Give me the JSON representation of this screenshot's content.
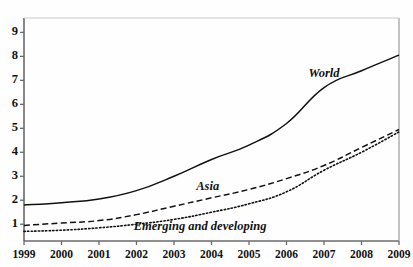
{
  "chart_data": {
    "type": "line",
    "title": "",
    "subtitle": "",
    "xlabel": "",
    "ylabel": "",
    "x": [
      1999,
      2000,
      2001,
      2002,
      2003,
      2004,
      2005,
      2006,
      2007,
      2008,
      2009
    ],
    "xtick_labels": [
      "1999",
      "2000",
      "2001",
      "2002",
      "2003",
      "2004",
      "2005",
      "2006",
      "2007",
      "2008",
      "2009"
    ],
    "ytick_labels": [
      "1",
      "2",
      "3",
      "4",
      "5",
      "6",
      "7",
      "8",
      "9"
    ],
    "ytick_values": [
      1,
      2,
      3,
      4,
      5,
      6,
      7,
      8,
      9
    ],
    "xlim": [
      1999,
      2009
    ],
    "ylim": [
      0.3,
      9.6
    ],
    "grid": false,
    "legend_position": "inline-annotations",
    "series": [
      {
        "name": "World",
        "style": "solid",
        "color": "#111111",
        "values": [
          1.8,
          1.9,
          2.05,
          2.4,
          3.0,
          3.7,
          4.3,
          5.2,
          6.7,
          7.4,
          8.05
        ],
        "label_x": 2007.0,
        "label_y": 7.25
      },
      {
        "name": "Asia",
        "style": "dashed",
        "color": "#111111",
        "values": [
          0.95,
          1.05,
          1.15,
          1.4,
          1.75,
          2.1,
          2.45,
          2.9,
          3.45,
          4.2,
          4.95
        ],
        "label_x": 2003.9,
        "label_y": 2.55
      },
      {
        "name": "Emerging and developing",
        "style": "dotted",
        "color": "#111111",
        "values": [
          0.7,
          0.75,
          0.85,
          1.0,
          1.2,
          1.5,
          1.85,
          2.35,
          3.25,
          4.0,
          4.85
        ],
        "label_x": 2003.7,
        "label_y": 0.9
      }
    ]
  },
  "axes": {
    "y_axis_name": "value-axis",
    "x_axis_name": "year-axis"
  }
}
